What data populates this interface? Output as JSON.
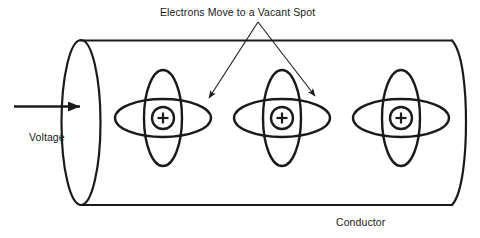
{
  "figure": {
    "title": "Electrons Move to a Vacant Spot",
    "background_color": "#ffffff",
    "line_color": "#1a1a1a",
    "text_color": "#1a1a1a"
  },
  "labels": {
    "annotation": "Electrons Move to a Vacant Spot",
    "voltage": "Voltage",
    "conductor": "Conductor"
  },
  "atoms": [
    {
      "id": "atom-1",
      "nucleus_charge": "+"
    },
    {
      "id": "atom-2",
      "nucleus_charge": "+"
    },
    {
      "id": "atom-3",
      "nucleus_charge": "+"
    }
  ],
  "arrows": {
    "voltage_arrow": "arrow pointing right into conductor",
    "annotation_arrow_left": "arrow pointing down-left to atom 1 orbit",
    "annotation_arrow_right": "arrow pointing down-right to atom 2 orbit"
  }
}
